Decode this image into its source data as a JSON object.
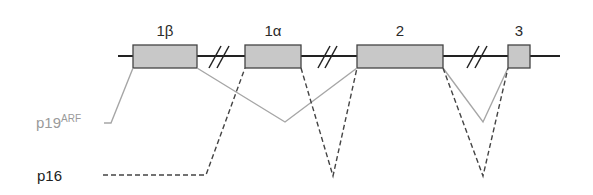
{
  "diagram": {
    "title": "",
    "colors": {
      "backbone": "#222222",
      "exon_fill": "#c8c8c8",
      "exon_stroke": "#444444",
      "p19_line": "#a6a6a6",
      "p19_label": "#9a9a9a",
      "p16_line": "#444444",
      "p16_label": "#222222"
    },
    "exons": [
      {
        "id": "exon-1beta",
        "label": "1β",
        "x": 133,
        "width": 64
      },
      {
        "id": "exon-1alpha",
        "label": "1α",
        "x": 245,
        "width": 56
      },
      {
        "id": "exon-2",
        "label": "2",
        "x": 357,
        "width": 86
      },
      {
        "id": "exon-3",
        "label": "3",
        "x": 508,
        "width": 22
      }
    ],
    "breaks": [
      {
        "x": 216
      },
      {
        "x": 324
      },
      {
        "x": 474
      }
    ],
    "transcripts": {
      "p19": {
        "label": "p19",
        "superscript": "ARF"
      },
      "p16": {
        "label": "p16"
      }
    }
  }
}
